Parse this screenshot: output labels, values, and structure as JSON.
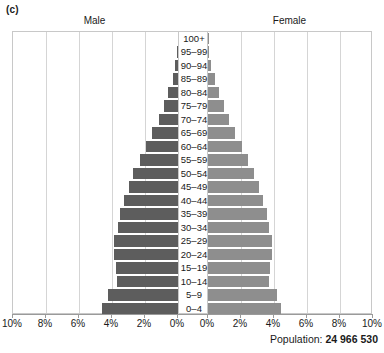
{
  "panel": {
    "label": "(c)"
  },
  "headers": {
    "male": "Male",
    "female": "Female"
  },
  "footer": {
    "population_prefix": "Population:",
    "population_value": "24 966 530"
  },
  "colors": {
    "male_bar": "#5d5d5d",
    "female_bar": "#8e8e8e",
    "gridline": "#d5d5d5",
    "frame": "#c8c8c8",
    "background": "#ffffff"
  },
  "chart_data": {
    "type": "bar",
    "subtype": "population-pyramid",
    "title": "(c)",
    "xlabel": "",
    "ylabel": "",
    "grid": true,
    "legend_position": "top",
    "xlim": [
      -10,
      10
    ],
    "xtick_labels_left": [
      "10%",
      "8%",
      "6%",
      "4%",
      "2%",
      "0%"
    ],
    "xtick_labels_right": [
      "0%",
      "2%",
      "4%",
      "6%",
      "8%",
      "10%"
    ],
    "xtick_values": [
      10,
      8,
      6,
      4,
      2,
      0,
      0,
      2,
      4,
      6,
      8,
      10
    ],
    "categories": [
      "100+",
      "95–99",
      "90–94",
      "85–89",
      "80–84",
      "75–79",
      "70–74",
      "65–69",
      "60–64",
      "55–59",
      "50–54",
      "45–49",
      "40–44",
      "35–39",
      "30–34",
      "25–29",
      "20–24",
      "15–19",
      "10–14",
      "5–9",
      "0–4"
    ],
    "series": [
      {
        "name": "Male",
        "color": "#5d5d5d",
        "unit": "%",
        "values": [
          0.02,
          0.06,
          0.17,
          0.33,
          0.58,
          0.85,
          1.15,
          1.55,
          1.95,
          2.3,
          2.7,
          3.0,
          3.25,
          3.5,
          3.65,
          3.85,
          3.85,
          3.75,
          3.7,
          4.25,
          4.6
        ]
      },
      {
        "name": "Female",
        "color": "#8e8e8e",
        "unit": "%",
        "values": [
          0.02,
          0.07,
          0.2,
          0.4,
          0.68,
          0.95,
          1.25,
          1.65,
          2.05,
          2.4,
          2.8,
          3.1,
          3.35,
          3.55,
          3.7,
          3.85,
          3.85,
          3.75,
          3.7,
          4.2,
          4.45
        ]
      }
    ],
    "annotations": [
      "Population: 24 966 530"
    ]
  }
}
